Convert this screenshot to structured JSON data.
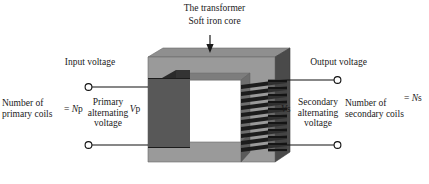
{
  "diagram": {
    "title": "The transformer",
    "core_label": "Soft iron core",
    "arrow_icon": "down-arrow-icon"
  },
  "left": {
    "input_voltage": "Input voltage",
    "number_of_primary_coils": "Number of\nprimary coils",
    "number_of_primary_coils_line1": "Number of",
    "number_of_primary_coils_line2": "primary coils",
    "primary_coils_equals": "= Np",
    "primary_coils_symbol_prefix": "= ",
    "primary_coils_symbol_italic": "N",
    "primary_coils_symbol_suffix": "p",
    "primary_voltage_line1": "Primary",
    "primary_voltage_line2": "alternating",
    "primary_voltage_line3": "voltage",
    "primary_voltage_symbol_italic": "V",
    "primary_voltage_symbol_suffix": "p",
    "terminal_top": "primary-terminal-top",
    "terminal_bottom": "primary-terminal-bottom"
  },
  "right": {
    "output_voltage": "Output voltage",
    "number_of_secondary_coils_line1": "Number of",
    "number_of_secondary_coils_line2": "secondary coils",
    "secondary_coils_symbol_prefix": "= ",
    "secondary_coils_symbol_italic": "N",
    "secondary_coils_symbol_suffix": "s",
    "secondary_voltage_line1": "Secondary",
    "secondary_voltage_line2": "alternating",
    "secondary_voltage_line3": "voltage",
    "secondary_voltage_symbol_italic": "V",
    "secondary_voltage_symbol_suffix": "s",
    "terminal_top": "secondary-terminal-top",
    "terminal_bottom": "secondary-terminal-bottom"
  },
  "colors": {
    "background": "#ffffff",
    "core_front": "#9a9a9a",
    "core_top": "#8f8f8f",
    "core_side_dark": "#4a4a4a",
    "core_inner_shadow": "#6e6e6e",
    "coil_dark": "#1c1c1c",
    "coil_mid": "#3a3a3a",
    "wire": "#111111",
    "text": "#1a1a1a"
  },
  "geometry": {
    "primary_winding_count": 34,
    "secondary_winding_count": 10,
    "core_window_label": "core-window"
  }
}
